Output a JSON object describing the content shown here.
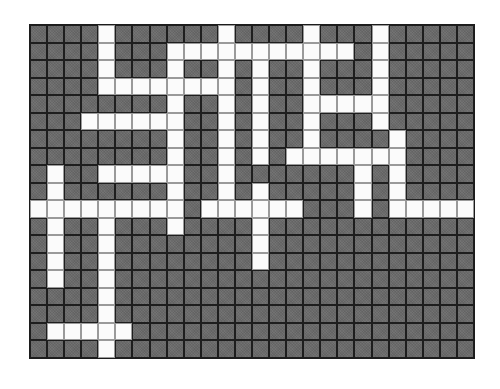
{
  "puzzle": {
    "type": "crossword-grid",
    "columns": 26,
    "rows": 19,
    "colors": {
      "block": "#6b6b6b",
      "open": "#fbfbfb",
      "grid_line": "#1c1c1c"
    },
    "open_cells_by_row": [
      [
        4,
        11,
        16,
        20
      ],
      [
        4,
        8,
        9,
        10,
        11,
        12,
        13,
        14,
        15,
        16,
        17,
        18,
        20
      ],
      [
        4,
        8,
        11,
        13,
        16,
        20
      ],
      [
        4,
        5,
        6,
        7,
        8,
        9,
        10,
        11,
        13,
        16,
        20
      ],
      [
        8,
        11,
        13,
        16,
        17,
        18,
        19,
        20
      ],
      [
        3,
        4,
        5,
        6,
        7,
        8,
        11,
        13,
        16,
        20
      ],
      [
        8,
        11,
        13,
        16,
        21
      ],
      [
        8,
        11,
        13,
        15,
        16,
        17,
        18,
        19,
        20,
        21
      ],
      [
        1,
        4,
        5,
        6,
        7,
        8,
        11,
        19,
        21
      ],
      [
        1,
        8,
        11,
        13,
        19,
        21
      ],
      [
        0,
        1,
        2,
        3,
        4,
        5,
        6,
        7,
        8,
        10,
        11,
        12,
        13,
        14,
        15,
        19,
        21,
        22,
        23,
        24,
        25
      ],
      [
        1,
        4,
        8,
        13
      ],
      [
        1,
        4,
        13
      ],
      [
        1,
        4,
        13
      ],
      [
        1,
        4
      ],
      [
        4
      ],
      [
        4
      ],
      [
        1,
        2,
        3,
        4,
        5
      ],
      [
        4
      ]
    ]
  }
}
